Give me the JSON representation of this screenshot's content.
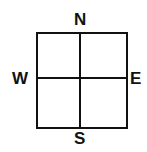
{
  "diagram": {
    "type": "compass-grid",
    "labels": {
      "north": "N",
      "south": "S",
      "west": "W",
      "east": "E"
    },
    "grid": {
      "rows": 2,
      "cols": 2
    },
    "line_color": "#111111"
  }
}
